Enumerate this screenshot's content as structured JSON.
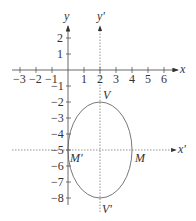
{
  "diagram": {
    "axes": {
      "x_label": "x",
      "y_label": "y",
      "x_prime_label": "x'",
      "y_prime_label": "y'"
    },
    "x_ticks": [
      "-3",
      "-2",
      "-1",
      "1",
      "2",
      "3",
      "4",
      "5",
      "6"
    ],
    "y_ticks": [
      "2",
      "1",
      "-1",
      "-2",
      "-3",
      "-4",
      "-5",
      "-6",
      "-7",
      "-8"
    ],
    "ellipse": {
      "center": [
        2,
        -5
      ],
      "a_horizontal": 2,
      "b_vertical": 3
    },
    "points": {
      "V": "V",
      "V_prime": "V'",
      "M": "M",
      "M_prime": "M'"
    }
  }
}
